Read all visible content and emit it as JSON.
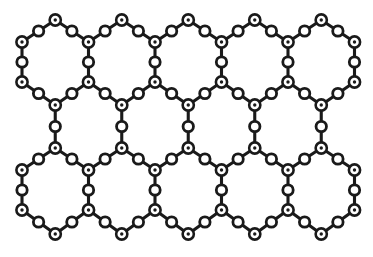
{
  "figure": {
    "background_color": "#ffffff",
    "line_color": "#1a1a1a",
    "node_fill_color": "#ffffff",
    "dot_color": "#1a1a1a",
    "bond_stroke_width": 3.1,
    "node_ring_stroke_width": 2.6,
    "vertex_node_radius": 5.6,
    "vertex_dot_radius": 1.7,
    "bridge_node_radius": 5.2,
    "bridge_ring_stroke_width": 2.8
  },
  "lattice": {
    "type": "honeycomb",
    "orientation": "pointy-top",
    "column_spacing": 66.5,
    "rows_of_hexagons": 2,
    "hexagons_per_row": 5,
    "column_x": [
      22,
      55.25,
      88.5,
      121.75,
      155,
      188.25,
      221.5,
      254.75,
      288,
      321.25,
      354.5
    ],
    "row_y": {
      "top_apex": 20,
      "upper_shoulder": 42,
      "upper_mid": 62,
      "upper_waist": 82,
      "center_apex": 105,
      "center_lower": 148,
      "lower_shoulder": 170,
      "lower_mid": 190,
      "lower_waist": 210,
      "bottom_apex": 234
    }
  },
  "nodes": {
    "vertex_label": "three-coordinate atom",
    "bridge_label": "two-coordinate bridging atom",
    "vertex_positions": [
      [
        22,
        42
      ],
      [
        88.5,
        42
      ],
      [
        155,
        42
      ],
      [
        221.5,
        42
      ],
      [
        288,
        42
      ],
      [
        354.5,
        42
      ],
      [
        55.25,
        20
      ],
      [
        121.75,
        20
      ],
      [
        188.25,
        20
      ],
      [
        254.75,
        20
      ],
      [
        321.25,
        20
      ],
      [
        22,
        82
      ],
      [
        88.5,
        82
      ],
      [
        155,
        82
      ],
      [
        221.5,
        82
      ],
      [
        288,
        82
      ],
      [
        354.5,
        82
      ],
      [
        55.25,
        105
      ],
      [
        121.75,
        105
      ],
      [
        188.25,
        105
      ],
      [
        254.75,
        105
      ],
      [
        321.25,
        105
      ],
      [
        55.25,
        148
      ],
      [
        121.75,
        148
      ],
      [
        188.25,
        148
      ],
      [
        254.75,
        148
      ],
      [
        321.25,
        148
      ],
      [
        22,
        170
      ],
      [
        88.5,
        170
      ],
      [
        155,
        170
      ],
      [
        221.5,
        170
      ],
      [
        288,
        170
      ],
      [
        354.5,
        170
      ],
      [
        22,
        210
      ],
      [
        88.5,
        210
      ],
      [
        155,
        210
      ],
      [
        221.5,
        210
      ],
      [
        288,
        210
      ],
      [
        354.5,
        210
      ],
      [
        55.25,
        234
      ],
      [
        121.75,
        234
      ],
      [
        188.25,
        234
      ],
      [
        254.75,
        234
      ],
      [
        321.25,
        234
      ]
    ],
    "bridge_positions": [
      [
        38.6,
        31
      ],
      [
        71.9,
        31
      ],
      [
        105.1,
        31
      ],
      [
        138.4,
        31
      ],
      [
        171.6,
        31
      ],
      [
        204.9,
        31
      ],
      [
        238.1,
        31
      ],
      [
        271.4,
        31
      ],
      [
        304.6,
        31
      ],
      [
        337.9,
        31
      ],
      [
        22,
        62
      ],
      [
        88.5,
        62
      ],
      [
        155,
        62
      ],
      [
        221.5,
        62
      ],
      [
        288,
        62
      ],
      [
        354.5,
        62
      ],
      [
        38.6,
        93.5
      ],
      [
        71.9,
        93.5
      ],
      [
        105.1,
        93.5
      ],
      [
        138.4,
        93.5
      ],
      [
        171.6,
        93.5
      ],
      [
        204.9,
        93.5
      ],
      [
        238.1,
        93.5
      ],
      [
        271.4,
        93.5
      ],
      [
        304.6,
        93.5
      ],
      [
        337.9,
        93.5
      ],
      [
        55.25,
        126.5
      ],
      [
        121.75,
        126.5
      ],
      [
        188.25,
        126.5
      ],
      [
        254.75,
        126.5
      ],
      [
        321.25,
        126.5
      ],
      [
        38.6,
        159
      ],
      [
        71.9,
        159
      ],
      [
        105.1,
        159
      ],
      [
        138.4,
        159
      ],
      [
        171.6,
        159
      ],
      [
        204.9,
        159
      ],
      [
        238.1,
        159
      ],
      [
        271.4,
        159
      ],
      [
        304.6,
        159
      ],
      [
        337.9,
        159
      ],
      [
        22,
        190
      ],
      [
        88.5,
        190
      ],
      [
        155,
        190
      ],
      [
        221.5,
        190
      ],
      [
        288,
        190
      ],
      [
        354.5,
        190
      ],
      [
        38.6,
        222
      ],
      [
        71.9,
        222
      ],
      [
        105.1,
        222
      ],
      [
        138.4,
        222
      ],
      [
        171.6,
        222
      ],
      [
        204.9,
        222
      ],
      [
        238.1,
        222
      ],
      [
        271.4,
        222
      ],
      [
        304.6,
        222
      ],
      [
        337.9,
        222
      ]
    ]
  },
  "bonds": {
    "segments": [
      [
        22,
        42,
        55.25,
        20
      ],
      [
        55.25,
        20,
        88.5,
        42
      ],
      [
        88.5,
        42,
        121.75,
        20
      ],
      [
        121.75,
        20,
        155,
        42
      ],
      [
        155,
        42,
        188.25,
        20
      ],
      [
        188.25,
        20,
        221.5,
        42
      ],
      [
        221.5,
        42,
        254.75,
        20
      ],
      [
        254.75,
        20,
        288,
        42
      ],
      [
        288,
        42,
        321.25,
        20
      ],
      [
        321.25,
        20,
        354.5,
        42
      ],
      [
        22,
        42,
        22,
        82
      ],
      [
        88.5,
        42,
        88.5,
        82
      ],
      [
        155,
        42,
        155,
        82
      ],
      [
        221.5,
        42,
        221.5,
        82
      ],
      [
        288,
        42,
        288,
        82
      ],
      [
        354.5,
        42,
        354.5,
        82
      ],
      [
        22,
        82,
        55.25,
        105
      ],
      [
        55.25,
        105,
        88.5,
        82
      ],
      [
        88.5,
        82,
        121.75,
        105
      ],
      [
        121.75,
        105,
        155,
        82
      ],
      [
        155,
        82,
        188.25,
        105
      ],
      [
        188.25,
        105,
        221.5,
        82
      ],
      [
        221.5,
        82,
        254.75,
        105
      ],
      [
        254.75,
        105,
        288,
        82
      ],
      [
        288,
        82,
        321.25,
        105
      ],
      [
        321.25,
        105,
        354.5,
        82
      ],
      [
        55.25,
        105,
        55.25,
        148
      ],
      [
        121.75,
        105,
        121.75,
        148
      ],
      [
        188.25,
        105,
        188.25,
        148
      ],
      [
        254.75,
        105,
        254.75,
        148
      ],
      [
        321.25,
        105,
        321.25,
        148
      ],
      [
        22,
        170,
        55.25,
        148
      ],
      [
        55.25,
        148,
        88.5,
        170
      ],
      [
        88.5,
        170,
        121.75,
        148
      ],
      [
        121.75,
        148,
        155,
        170
      ],
      [
        155,
        170,
        188.25,
        148
      ],
      [
        188.25,
        148,
        221.5,
        170
      ],
      [
        221.5,
        170,
        254.75,
        148
      ],
      [
        254.75,
        148,
        288,
        170
      ],
      [
        288,
        170,
        321.25,
        148
      ],
      [
        321.25,
        148,
        354.5,
        170
      ],
      [
        22,
        170,
        22,
        210
      ],
      [
        88.5,
        170,
        88.5,
        210
      ],
      [
        155,
        170,
        155,
        210
      ],
      [
        221.5,
        170,
        221.5,
        210
      ],
      [
        288,
        170,
        288,
        210
      ],
      [
        354.5,
        170,
        354.5,
        210
      ],
      [
        22,
        210,
        55.25,
        234
      ],
      [
        55.25,
        234,
        88.5,
        210
      ],
      [
        88.5,
        210,
        121.75,
        234
      ],
      [
        121.75,
        234,
        155,
        210
      ],
      [
        155,
        210,
        188.25,
        234
      ],
      [
        188.25,
        234,
        221.5,
        210
      ],
      [
        221.5,
        210,
        254.75,
        234
      ],
      [
        254.75,
        234,
        288,
        210
      ],
      [
        288,
        210,
        321.25,
        234
      ],
      [
        321.25,
        234,
        354.5,
        210
      ]
    ]
  }
}
